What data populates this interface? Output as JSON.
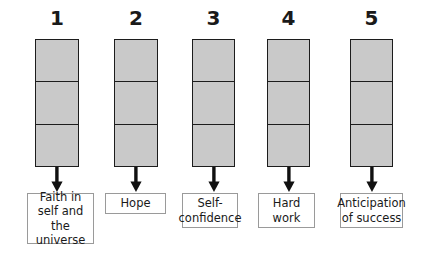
{
  "diagram": {
    "type": "flow-columns",
    "fill_color": "#c9c9c9",
    "bar_border_color": "#1c1c1c",
    "label_border_color": "#9a9a9a",
    "background_color": "#ffffff",
    "segments_per_bar": 3,
    "columns": [
      {
        "number": "1",
        "label": "Faith in\nself and the\nuniverse",
        "left": 35,
        "bar_width": 44,
        "bar_height": 128,
        "box_left": 27,
        "box_width": 67,
        "box_height": 51
      },
      {
        "number": "2",
        "label": "Hope",
        "left": 114,
        "bar_width": 44,
        "bar_height": 128,
        "box_left": 105,
        "box_width": 61,
        "box_height": 21
      },
      {
        "number": "3",
        "label": "Self-\nconfidence",
        "left": 192,
        "bar_width": 43,
        "bar_height": 128,
        "box_left": 182,
        "box_width": 56,
        "box_height": 35
      },
      {
        "number": "4",
        "label": "Hard\nwork",
        "left": 267,
        "bar_width": 43,
        "bar_height": 128,
        "box_left": 258,
        "box_width": 57,
        "box_height": 35
      },
      {
        "number": "5",
        "label": "Anticipation\nof success",
        "left": 350,
        "bar_width": 43,
        "bar_height": 128,
        "box_left": 340,
        "box_width": 63,
        "box_height": 35
      }
    ]
  }
}
